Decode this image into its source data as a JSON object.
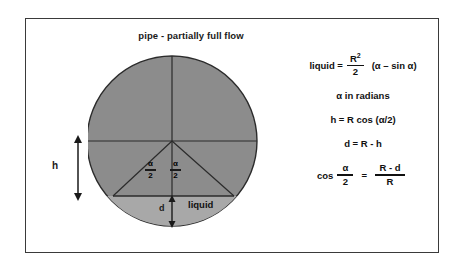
{
  "figure": {
    "title": "pipe - partially full flow",
    "background_color": "#ffffff",
    "border_color": "#3a3a3a"
  },
  "diagram": {
    "upper_segment_fill": "#8c8c8c",
    "liquid_segment_fill": "#a8a8a8",
    "line_color": "#2b2b2b",
    "labels": {
      "h": "h",
      "d": "d",
      "liquid": "liquid",
      "alpha_left_num": "α",
      "alpha_left_den": "2",
      "alpha_right_num": "α",
      "alpha_right_den": "2"
    }
  },
  "equations": {
    "liquid": {
      "lhs": "liquid =",
      "frac_num": "R",
      "frac_num_sup": "2",
      "frac_den": "2",
      "rhs": "(α – sin α)"
    },
    "radians": {
      "text": "α in radians"
    },
    "h": {
      "text": "h = R cos (α/2)"
    },
    "d": {
      "text": "d = R - h"
    },
    "cos": {
      "lhs": "cos",
      "left_frac_num": "α",
      "left_frac_den": "2",
      "equals": "=",
      "right_frac_num": "R - d",
      "right_frac_den": "R"
    }
  }
}
